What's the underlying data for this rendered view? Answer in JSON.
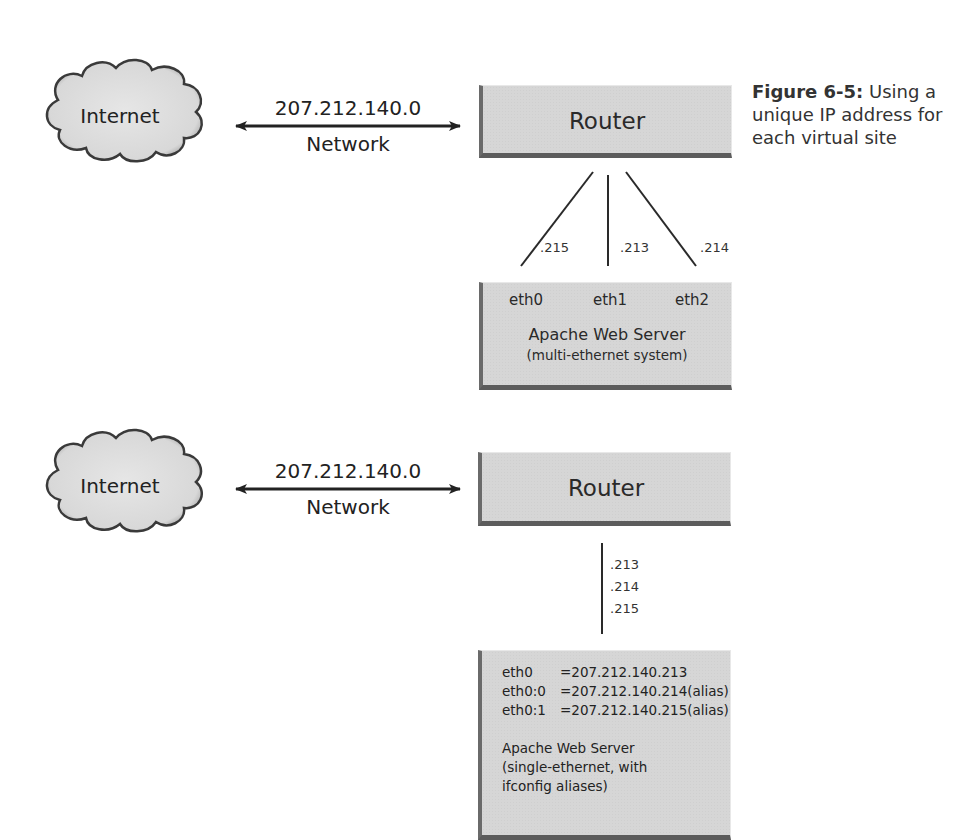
{
  "figure": {
    "number": "Figure 6-5:",
    "caption": "Using a unique IP address for each virtual site"
  },
  "top_diagram": {
    "cloud_label": "Internet",
    "network_address": "207.212.140.0",
    "network_label": "Network",
    "router_label": "Router",
    "links": [
      {
        "label": ".215"
      },
      {
        "label": ".213"
      },
      {
        "label": ".214"
      }
    ],
    "server": {
      "interfaces": [
        "eth0",
        "eth1",
        "eth2"
      ],
      "title": "Apache Web Server",
      "subtitle": "(multi-ethernet system)"
    }
  },
  "bottom_diagram": {
    "cloud_label": "Internet",
    "network_address": "207.212.140.0",
    "network_label": "Network",
    "router_label": "Router",
    "link_labels": [
      ".213",
      ".214",
      ".215"
    ],
    "server": {
      "aliases": [
        {
          "iface": "eth0",
          "value": "=207.212.140.213"
        },
        {
          "iface": "eth0:0",
          "value": "=207.212.140.214(alias)"
        },
        {
          "iface": "eth0:1",
          "value": "=207.212.140.215(alias)"
        }
      ],
      "title": "Apache Web Server",
      "subtitle_line1": "(single-ethernet, with",
      "subtitle_line2": "ifconfig aliases)"
    }
  },
  "colors": {
    "box_fill": "#d6d6d6",
    "box_shadow": "#5c5c5c",
    "line": "#2a2a2a",
    "cloud_fill": "#e2e2e2",
    "cloud_stroke": "#3a3a3a"
  }
}
